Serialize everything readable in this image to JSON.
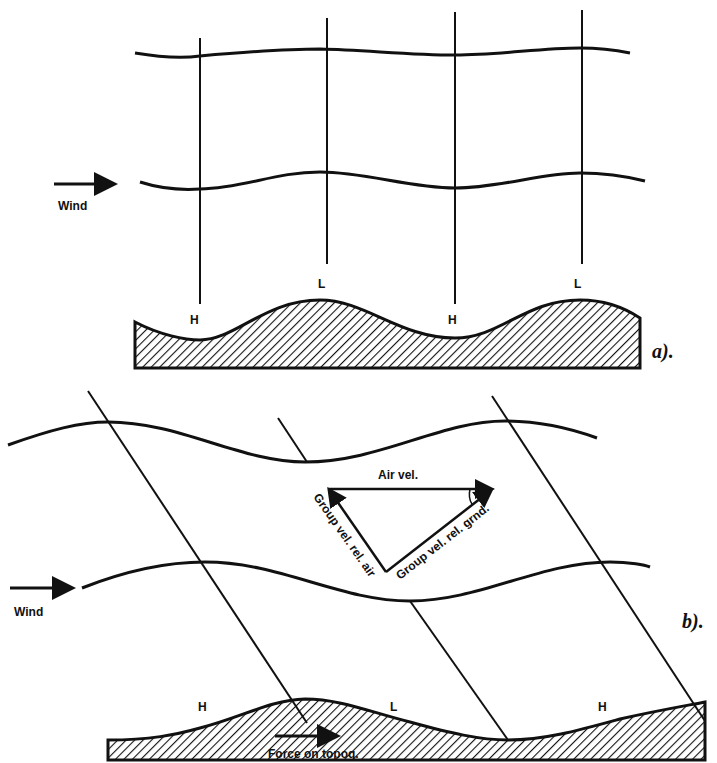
{
  "figure": {
    "panel_a": {
      "tag": "a).",
      "wind_label": "Wind",
      "labels": {
        "H1": "H",
        "L1": "L",
        "H2": "H",
        "L2": "L"
      }
    },
    "panel_b": {
      "tag": "b).",
      "wind_label": "Wind",
      "triangle": {
        "air_vel": "Air vel.",
        "group_rel_air": "Group vel. rel. air",
        "group_rel_grnd": "Group vel. rel. grnd."
      },
      "labels": {
        "H1": "H",
        "L1": "L",
        "H2": "H"
      },
      "force_label": "Force on topog."
    },
    "colors": {
      "ink": "#111111",
      "background": "#ffffff"
    }
  }
}
